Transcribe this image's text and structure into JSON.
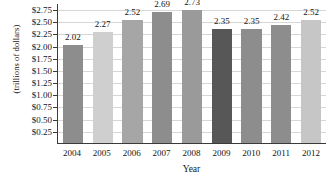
{
  "chart_data": {
    "type": "bar",
    "title": "",
    "subtitle": "",
    "xlabel": "Year",
    "ylabel": "(trillions of dollars)",
    "categories": [
      "2004",
      "2005",
      "2006",
      "2007",
      "2008",
      "2009",
      "2010",
      "2011",
      "2012"
    ],
    "values": [
      2.02,
      2.27,
      2.52,
      2.69,
      2.73,
      2.35,
      2.35,
      2.42,
      2.52
    ],
    "value_labels": [
      "2.02",
      "2.27",
      "2.52",
      "2.69",
      "2.73",
      "2.35",
      "2.35",
      "2.42",
      "2.52"
    ],
    "bar_colors": [
      "#8d8d8d",
      "#cfcfcf",
      "#a6a6a6",
      "#8d8d8d",
      "#9a9a9a",
      "#575757",
      "#8d8d8d",
      "#8d8d8d",
      "#c6c6c6"
    ],
    "ylim": [
      0,
      2.875
    ],
    "ytick_values": [
      0.25,
      0.5,
      0.75,
      1.0,
      1.25,
      1.5,
      1.75,
      2.0,
      2.25,
      2.5,
      2.75
    ],
    "ytick_labels": [
      "$0.25",
      "$0.50",
      "$0.75",
      "$1.00",
      "$1.25",
      "$1.50",
      "$1.75",
      "$2.00",
      "$2.25",
      "$2.50",
      "$2.75"
    ],
    "grid": true,
    "grid_axis": "y",
    "legend": false,
    "legend_position": "none",
    "axis_color": "#3a3a3a",
    "grid_color": "#d7d7d7",
    "background": "#ffffff"
  }
}
